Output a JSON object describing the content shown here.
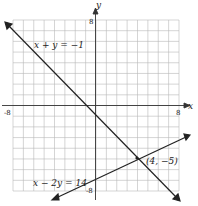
{
  "chart_data": {
    "type": "line",
    "title": "",
    "xlabel": "x",
    "ylabel": "y",
    "xlim": [
      -8,
      8
    ],
    "ylim": [
      -8,
      8
    ],
    "grid": true,
    "tick_labels": {
      "x_min": "-8",
      "x_max": "8",
      "y_max": "8",
      "y_min": "-8"
    },
    "series": [
      {
        "name": "x + y = −1",
        "equation": "x + y = -1",
        "points": [
          [
            -8,
            7
          ],
          [
            8,
            -9
          ]
        ]
      },
      {
        "name": "x − 2y = 14",
        "equation": "x - 2y = 14",
        "points": [
          [
            -4,
            -9
          ],
          [
            8,
            -3
          ]
        ]
      }
    ],
    "annotations": [
      {
        "text": "(4, −5)",
        "x": 4,
        "y": -5
      }
    ]
  }
}
